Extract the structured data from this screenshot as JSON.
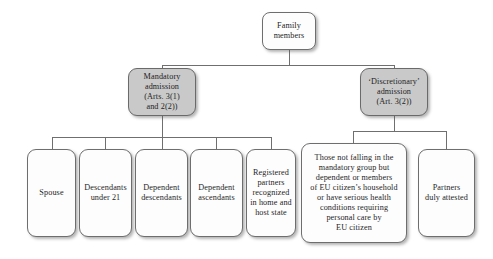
{
  "diagram": {
    "type": "tree",
    "title_text": "",
    "colors": {
      "root_fill": "#fdfdfd",
      "branch_fill": "#c9c9c9",
      "leaf_fill": "#fdfdfd",
      "border": "#6e6e6e",
      "connector": "#6f6f6f",
      "text": "#1d1d1f",
      "page_background": "#ffffff"
    },
    "root": {
      "id": "family-members",
      "label": "Family\nmembers",
      "line1": "Family",
      "line2": "members"
    },
    "branches": [
      {
        "id": "mandatory-admission",
        "label": "Mandatory admission (Arts. 3(1) and 2(2))",
        "lines": [
          "Mandatory",
          "admission",
          "(Arts. 3(1)",
          "and 2(2))"
        ],
        "children_ids": [
          "spouse",
          "descendants-under-21",
          "dependent-descendants",
          "dependent-ascendants",
          "registered-partners"
        ]
      },
      {
        "id": "discretionary-admission",
        "label": "'Discretionary' admission (Art. 3(2))",
        "lines": [
          "‘Discretionary’",
          "admission",
          "(Art. 3(2))"
        ],
        "children_ids": [
          "those-not-falling",
          "partners-duly-attested"
        ]
      }
    ],
    "leaves": [
      {
        "id": "spouse",
        "label": "Spouse",
        "lines": [
          "Spouse"
        ]
      },
      {
        "id": "descendants-under-21",
        "label": "Descendants under 21",
        "lines": [
          "Descendants",
          "under 21"
        ]
      },
      {
        "id": "dependent-descendants",
        "label": "Dependent descendants",
        "lines": [
          "Dependent",
          "descendants"
        ]
      },
      {
        "id": "dependent-ascendants",
        "label": "Dependent ascendants",
        "lines": [
          "Dependent",
          "ascendants"
        ]
      },
      {
        "id": "registered-partners",
        "label": "Registered partners recognized in home and host state",
        "lines": [
          "Registered",
          "partners",
          "recognized",
          "in home and",
          "host state"
        ]
      },
      {
        "id": "those-not-falling",
        "label": "Those not falling in the mandatory group but dependent or members of EU citizen's household or have serious health conditions requiring personal care by EU citizen",
        "lines": [
          "Those not falling in the",
          "mandatory  group but",
          "dependent or members",
          "of EU citizen’s household",
          "or have serious health",
          "conditions requiring",
          "personal care by",
          "EU citizen"
        ]
      },
      {
        "id": "partners-duly-attested",
        "label": "Partners duly attested",
        "lines": [
          "Partners",
          "duly attested"
        ]
      }
    ]
  }
}
